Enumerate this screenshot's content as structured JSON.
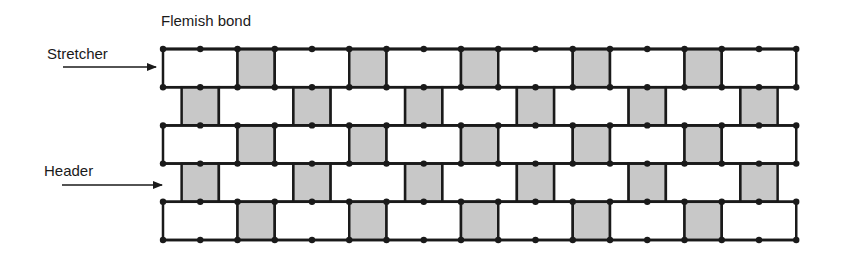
{
  "title": "Flemish bond",
  "labels": {
    "stretcher": "Stretcher",
    "header": "Header"
  },
  "colors": {
    "line": "#1a1a1a",
    "header_fill": "#c8c8c8",
    "stretcher_fill": "#ffffff"
  },
  "wall": {
    "left": 163,
    "top": 49,
    "unit": 37.25,
    "course_height": 38.2,
    "courses": [
      {
        "type": "stretcher-course",
        "offset": 0,
        "bricks": [
          "S",
          "H",
          "S",
          "H",
          "S",
          "H",
          "S",
          "H",
          "S",
          "H",
          "S"
        ]
      },
      {
        "type": "header-course",
        "offset": 0.5,
        "bricks": [
          "H",
          "S",
          "H",
          "S",
          "H",
          "S",
          "H",
          "S",
          "H",
          "S",
          "H"
        ]
      },
      {
        "type": "stretcher-course",
        "offset": 0,
        "bricks": [
          "S",
          "H",
          "S",
          "H",
          "S",
          "H",
          "S",
          "H",
          "S",
          "H",
          "S"
        ]
      },
      {
        "type": "header-course",
        "offset": 0.5,
        "bricks": [
          "H",
          "S",
          "H",
          "S",
          "H",
          "S",
          "H",
          "S",
          "H",
          "S",
          "H"
        ]
      },
      {
        "type": "stretcher-course",
        "offset": 0,
        "bricks": [
          "S",
          "H",
          "S",
          "H",
          "S",
          "H",
          "S",
          "H",
          "S",
          "H",
          "S"
        ]
      }
    ]
  }
}
